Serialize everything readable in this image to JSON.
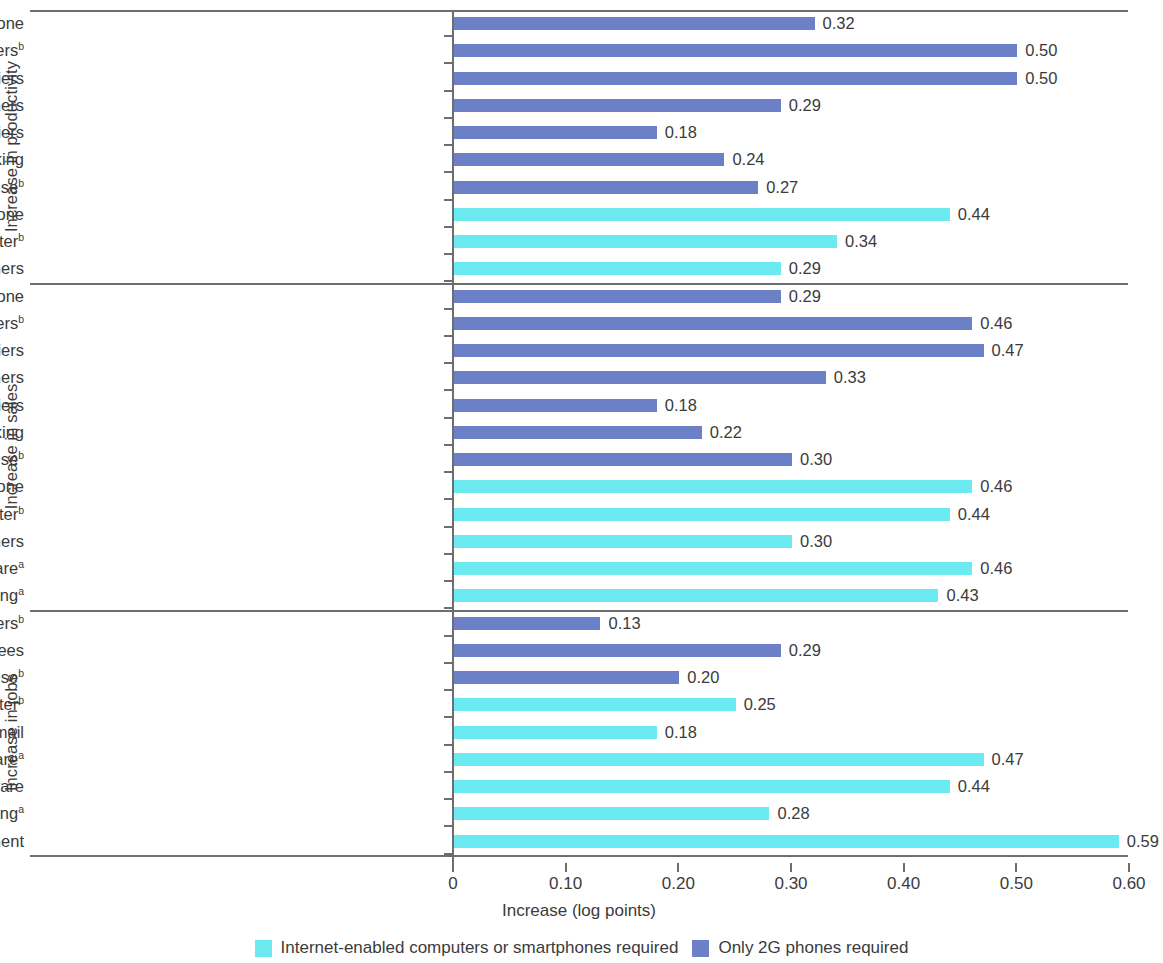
{
  "chart_data": {
    "type": "bar",
    "orientation": "horizontal",
    "title": "",
    "xlabel": "Increase (log points)",
    "ylabel": "",
    "xlim": [
      0,
      0.6
    ],
    "xticks": [
      "0",
      "0.10",
      "0.20",
      "0.30",
      "0.40",
      "0.50",
      "0.60"
    ],
    "xtick_values": [
      0,
      0.1,
      0.2,
      0.3,
      0.4,
      0.5,
      0.6
    ],
    "grid": false,
    "legend_position": "bottom",
    "value_label_format": "0.00",
    "series": [
      {
        "name": "Internet-enabled computers or smartphones required",
        "color": "#6ceaf2"
      },
      {
        "name": "Only 2G phones required",
        "color": "#6c80c8"
      }
    ],
    "groups": [
      {
        "title": "Increase in productivity",
        "rows": [
          {
            "label": "Use 2G mobile phone",
            "sup": "",
            "value": 0.32,
            "value_label": "0.32",
            "series": "Only 2G phones required"
          },
          {
            "label": "Use voice to communicate w/ customers",
            "sup": "b",
            "value": 0.5,
            "value_label": "0.50",
            "series": "Only 2G phones required"
          },
          {
            "label": "Use voice to communicate w/ suppliers",
            "sup": "",
            "value": 0.5,
            "value_label": "0.50",
            "series": "Only 2G phones required"
          },
          {
            "label": "Use MM to receive payments from customers",
            "sup": "",
            "value": 0.29,
            "value_label": "0.29",
            "series": "Only 2G phones required"
          },
          {
            "label": "Use MM to pay suppliers",
            "sup": "",
            "value": 0.18,
            "value_label": "0.18",
            "series": "Only 2G phones required"
          },
          {
            "label": "Use phone for banking",
            "sup": "",
            "value": 0.24,
            "value_label": "0.24",
            "series": "Only 2G phones required"
          },
          {
            "label": "Use SMS to advertise",
            "sup": "b",
            "value": 0.27,
            "value_label": "0.27",
            "series": "Only 2G phones required"
          },
          {
            "label": "Use 3G/4G smartphone",
            "sup": "",
            "value": 0.44,
            "value_label": "0.44",
            "series": "Internet-enabled computers or smartphones required"
          },
          {
            "label": "Use a computer",
            "sup": "b",
            "value": 0.34,
            "value_label": "0.34",
            "series": "Internet-enabled computers or smartphones required"
          },
          {
            "label": "Use internet to better understand customers",
            "sup": "",
            "value": 0.29,
            "value_label": "0.29",
            "series": "Internet-enabled computers or smartphones required"
          }
        ]
      },
      {
        "title": "Increase in sales",
        "rows": [
          {
            "label": "Use 2G mobile phone",
            "sup": "",
            "value": 0.29,
            "value_label": "0.29",
            "series": "Only 2G phones required"
          },
          {
            "label": "Use voice to communicate w/ customers",
            "sup": "b",
            "value": 0.46,
            "value_label": "0.46",
            "series": "Only 2G phones required"
          },
          {
            "label": "Use voice to communicate w/ suppliers",
            "sup": "",
            "value": 0.47,
            "value_label": "0.47",
            "series": "Only 2G phones required"
          },
          {
            "label": "Use MM to receive payments from customers",
            "sup": "",
            "value": 0.33,
            "value_label": "0.33",
            "series": "Only 2G phones required"
          },
          {
            "label": "Use MM to pay suppliers",
            "sup": "",
            "value": 0.18,
            "value_label": "0.18",
            "series": "Only 2G phones required"
          },
          {
            "label": "Use phone for banking",
            "sup": "",
            "value": 0.22,
            "value_label": "0.22",
            "series": "Only 2G phones required"
          },
          {
            "label": "Use SMS to advertise",
            "sup": "b",
            "value": 0.3,
            "value_label": "0.30",
            "series": "Only 2G phones required"
          },
          {
            "label": "Use 3G/4G smartphone",
            "sup": "",
            "value": 0.46,
            "value_label": "0.46",
            "series": "Internet-enabled computers or smartphones required"
          },
          {
            "label": "Use a computer",
            "sup": "b",
            "value": 0.44,
            "value_label": "0.44",
            "series": "Internet-enabled computers or smartphones required"
          },
          {
            "label": "Use internet to better understand customers",
            "sup": "",
            "value": 0.3,
            "value_label": "0.30",
            "series": "Internet-enabled computers or smartphones required"
          },
          {
            "label": "Use accounting software",
            "sup": "a",
            "value": 0.46,
            "value_label": "0.46",
            "series": "Internet-enabled computers or smartphones required"
          },
          {
            "label": "Use internet for online banking",
            "sup": "a",
            "value": 0.43,
            "value_label": "0.43",
            "series": "Internet-enabled computers or smartphones required"
          }
        ]
      },
      {
        "title": "Increase in jobs",
        "rows": [
          {
            "label": "Use voice to communicate w/ customers",
            "sup": "b",
            "value": 0.13,
            "value_label": "0.13",
            "series": "Only 2G phones required"
          },
          {
            "label": "Use MM to pay employees",
            "sup": "",
            "value": 0.29,
            "value_label": "0.29",
            "series": "Only 2G phones required"
          },
          {
            "label": "Use SMS to advertise",
            "sup": "b",
            "value": 0.2,
            "value_label": "0.20",
            "series": "Only 2G phones required"
          },
          {
            "label": "Use a computer",
            "sup": "b",
            "value": 0.25,
            "value_label": "0.25",
            "series": "Internet-enabled computers or smartphones required"
          },
          {
            "label": "Use internet for email",
            "sup": "",
            "value": 0.18,
            "value_label": "0.18",
            "series": "Internet-enabled computers or smartphones required"
          },
          {
            "label": "Use accounting software",
            "sup": "a",
            "value": 0.47,
            "value_label": "0.47",
            "series": "Internet-enabled computers or smartphones required"
          },
          {
            "label": "Use POS/inventory control software",
            "sup": "",
            "value": 0.44,
            "value_label": "0.44",
            "series": "Internet-enabled computers or smartphones required"
          },
          {
            "label": "Use internet for online banking",
            "sup": "a",
            "value": 0.28,
            "value_label": "0.28",
            "series": "Internet-enabled computers or smartphones required"
          },
          {
            "label": "Use internet for recruitment",
            "sup": "",
            "value": 0.59,
            "value_label": "0.59",
            "series": "Internet-enabled computers or smartphones required"
          }
        ]
      }
    ]
  },
  "legend": {
    "items": [
      {
        "label": "Internet-enabled computers or smartphones required",
        "color": "#6ceaf2"
      },
      {
        "label": "Only 2G phones required",
        "color": "#6c80c8"
      }
    ]
  },
  "axis": {
    "x_title": "Increase (log points)"
  }
}
